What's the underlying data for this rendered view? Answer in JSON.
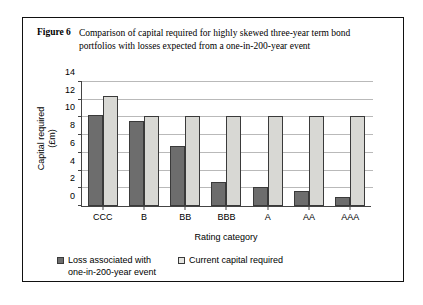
{
  "figure": {
    "label": "Figure 6",
    "caption": "Comparison of capital required for highly skewed three-year term bond portfolios with losses expected from a one-in-200-year event"
  },
  "chart_data": {
    "type": "bar",
    "title": "",
    "xlabel": "Rating category",
    "ylabel": "Capital required (£m)",
    "ylabel_line1": "Capital required",
    "ylabel_line2": "(£m)",
    "categories": [
      "CCC",
      "B",
      "BB",
      "BBB",
      "A",
      "AA",
      "AAA"
    ],
    "series": [
      {
        "name": "Loss associated with one-in-200-year event",
        "name_line1": "Loss associated with",
        "name_line2": "one-in-200-year event",
        "color": "#6d6d6d",
        "values": [
          10.3,
          9.6,
          6.8,
          2.7,
          2.1,
          1.7,
          1.0
        ]
      },
      {
        "name": "Current capital required",
        "color": "#d8d8d4",
        "values": [
          12.4,
          10.2,
          10.2,
          10.2,
          10.2,
          10.2,
          10.2
        ]
      }
    ],
    "ylim": [
      0,
      14
    ],
    "yticks": [
      0,
      2,
      4,
      6,
      8,
      10,
      12,
      14
    ],
    "grid": true,
    "legend_position": "bottom"
  }
}
